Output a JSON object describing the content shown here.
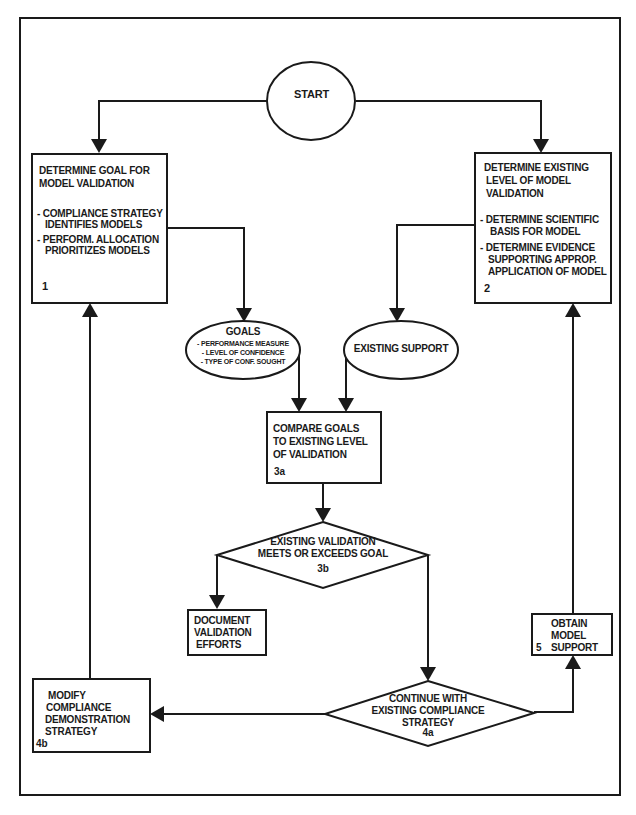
{
  "diagram": {
    "type": "flowchart",
    "colors": {
      "stroke": "#1a1a1a",
      "background": "#ffffff"
    },
    "start": {
      "label": "START"
    },
    "box1": {
      "id": "1",
      "title_lines": [
        "DETERMINE GOAL FOR",
        "MODEL VALIDATION"
      ],
      "bullets": [
        [
          "- COMPLIANCE STRATEGY",
          "IDENTIFIES MODELS"
        ],
        [
          "- PERFORM. ALLOCATION",
          "PRIORITIZES MODELS"
        ]
      ]
    },
    "box2": {
      "id": "2",
      "title_lines": [
        "DETERMINE EXISTING",
        "LEVEL OF MODEL",
        "VALIDATION"
      ],
      "bullets": [
        [
          "- DETERMINE SCIENTIFIC",
          "BASIS FOR MODEL"
        ],
        [
          "- DETERMINE EVIDENCE",
          "SUPPORTING APPROP.",
          "APPLICATION OF MODEL"
        ]
      ]
    },
    "goals": {
      "title": "GOALS",
      "items": [
        "- PERFORMANCE MEASURE",
        "- LEVEL OF CONFIDENCE",
        "- TYPE OF CONF. SOUGHT"
      ]
    },
    "existing_support": {
      "label": "EXISTING SUPPORT"
    },
    "box3a": {
      "id": "3a",
      "lines": [
        "COMPARE GOALS",
        "TO EXISTING LEVEL",
        "OF VALIDATION"
      ]
    },
    "decision3b": {
      "id": "3b",
      "lines": [
        "EXISTING VALIDATION",
        "MEETS OR EXCEEDS GOAL"
      ]
    },
    "document_box": {
      "lines": [
        "DOCUMENT",
        "VALIDATION",
        "EFFORTS"
      ]
    },
    "decision4a": {
      "id": "4a",
      "lines": [
        "CONTINUE WITH",
        "EXISTING COMPLIANCE",
        "STRATEGY"
      ]
    },
    "box4b": {
      "id": "4b",
      "lines": [
        "MODIFY",
        "COMPLIANCE",
        "DEMONSTRATION",
        "STRATEGY"
      ]
    },
    "box5": {
      "id": "5",
      "lines": [
        "OBTAIN",
        "MODEL",
        "SUPPORT"
      ]
    },
    "edges": [
      [
        "START",
        "1"
      ],
      [
        "START",
        "2"
      ],
      [
        "1",
        "GOALS"
      ],
      [
        "2",
        "EXISTING SUPPORT"
      ],
      [
        "GOALS",
        "3a"
      ],
      [
        "EXISTING SUPPORT",
        "3a"
      ],
      [
        "3a",
        "3b"
      ],
      [
        "3b",
        "DOCUMENT VALIDATION EFFORTS"
      ],
      [
        "3b",
        "4a"
      ],
      [
        "4a",
        "4b"
      ],
      [
        "4a",
        "5"
      ],
      [
        "4b",
        "1"
      ],
      [
        "5",
        "2"
      ]
    ]
  }
}
